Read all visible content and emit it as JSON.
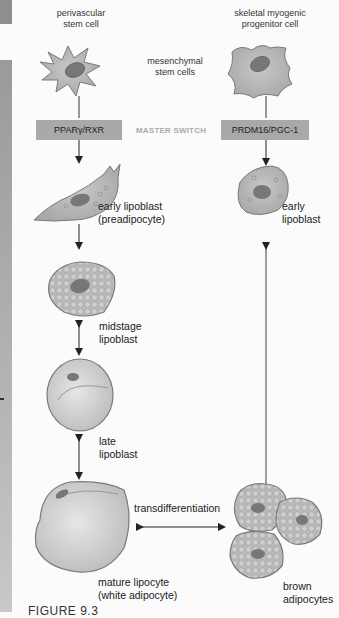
{
  "figure": {
    "left_column": {
      "progenitor_label": "perivascular\nstem cell",
      "master_switch": "PPARγ/RXR",
      "stages": [
        {
          "label_line1": "early lipoblast",
          "label_line2": "(preadipocyte)"
        },
        {
          "label_line1": "midstage",
          "label_line2": "lipoblast"
        },
        {
          "label_line1": "late",
          "label_line2": "lipoblast"
        },
        {
          "label_line1": "mature lipocyte",
          "label_line2": "(white adipocyte)"
        }
      ]
    },
    "center": {
      "mesenchymal_label_line1": "mesenchymal",
      "mesenchymal_label_line2": "stem cells",
      "master_switch_label": "MASTER SWITCH",
      "transdifferentiation_label": "transdifferentiation"
    },
    "right_column": {
      "progenitor_label_line1": "skeletal myogenic",
      "progenitor_label_line2": "progenitor cell",
      "master_switch": "PRDM16/PGC-1",
      "stages": [
        {
          "label_line1": "early",
          "label_line2": "lipoblast"
        },
        {
          "label_line1": "brown",
          "label_line2": "adipocytes"
        }
      ]
    },
    "caption_partial": "FIGURE 9.3"
  },
  "colors": {
    "cell_fill": "#b5b5b5",
    "cell_stroke": "#7a7a7a",
    "nucleus": "#6e6e6e",
    "switch_box": "#a9a9a9",
    "master_switch_text": "#aaaaaa"
  }
}
